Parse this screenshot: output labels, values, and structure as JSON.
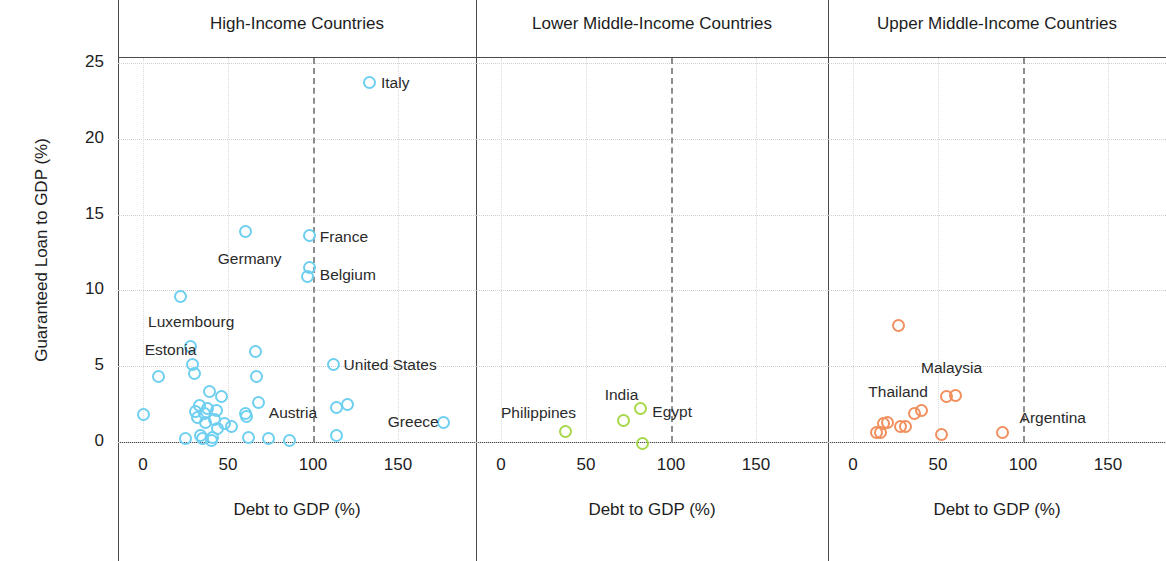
{
  "chart_data": {
    "type": "scatter",
    "title": "",
    "xlabel": "Debt to GDP (%)",
    "ylabel": "Guaranteed Loan to GDP (%)",
    "xlim": [
      -12,
      196
    ],
    "ylim": [
      -1.8,
      25.8
    ],
    "xticks": [
      0,
      50,
      100,
      150
    ],
    "yticks": [
      0,
      5,
      10,
      15,
      20,
      25
    ],
    "grid": true,
    "legend": "none",
    "threshold_line": {
      "x": 100,
      "style": "dashed",
      "color": "#8d8d8d"
    },
    "panels": [
      {
        "id": "high-income",
        "title": "High-Income Countries",
        "color": "#6ECFF0",
        "points": [
          {
            "x": 0,
            "y": 1.8
          },
          {
            "x": 9,
            "y": 4.3
          },
          {
            "x": 22,
            "y": 9.6
          },
          {
            "x": 25,
            "y": 0.2
          },
          {
            "x": 28,
            "y": 6.3
          },
          {
            "x": 29,
            "y": 5.1
          },
          {
            "x": 30,
            "y": 4.5
          },
          {
            "x": 31,
            "y": 2.0
          },
          {
            "x": 32,
            "y": 1.6
          },
          {
            "x": 33,
            "y": 2.4
          },
          {
            "x": 34,
            "y": 0.4
          },
          {
            "x": 35,
            "y": 0.2
          },
          {
            "x": 36,
            "y": 1.9
          },
          {
            "x": 37,
            "y": 1.3
          },
          {
            "x": 38,
            "y": 2.2
          },
          {
            "x": 39,
            "y": 3.3
          },
          {
            "x": 40,
            "y": 0.1
          },
          {
            "x": 41,
            "y": 0.3
          },
          {
            "x": 42,
            "y": 1.5
          },
          {
            "x": 43,
            "y": 2.1
          },
          {
            "x": 44,
            "y": 0.9
          },
          {
            "x": 46,
            "y": 3.0
          },
          {
            "x": 48,
            "y": 1.2
          },
          {
            "x": 52,
            "y": 1.0
          },
          {
            "x": 60,
            "y": 13.9
          },
          {
            "x": 60,
            "y": 1.9
          },
          {
            "x": 61,
            "y": 1.7
          },
          {
            "x": 62,
            "y": 0.3
          },
          {
            "x": 66,
            "y": 6.0
          },
          {
            "x": 67,
            "y": 4.3
          },
          {
            "x": 68,
            "y": 2.6
          },
          {
            "x": 74,
            "y": 0.2
          },
          {
            "x": 86,
            "y": 0.1
          },
          {
            "x": 98,
            "y": 13.6
          },
          {
            "x": 98,
            "y": 11.5
          },
          {
            "x": 97,
            "y": 10.9
          },
          {
            "x": 112,
            "y": 5.1
          },
          {
            "x": 114,
            "y": 2.3
          },
          {
            "x": 114,
            "y": 0.4
          },
          {
            "x": 120,
            "y": 2.5
          },
          {
            "x": 133,
            "y": 23.7
          },
          {
            "x": 177,
            "y": 1.3
          }
        ],
        "labels": [
          {
            "text": "Italy",
            "x": 140,
            "y": 23.7,
            "anchor": "left"
          },
          {
            "text": "France",
            "x": 104,
            "y": 13.5,
            "anchor": "left"
          },
          {
            "text": "Belgium",
            "x": 104,
            "y": 11.0,
            "anchor": "left"
          },
          {
            "text": "Germany",
            "x": 44,
            "y": 12.1,
            "anchor": "left"
          },
          {
            "text": "Luxembourg",
            "x": 3,
            "y": 7.9,
            "anchor": "left"
          },
          {
            "text": "Estonia",
            "x": 1,
            "y": 6.1,
            "anchor": "left"
          },
          {
            "text": "United States",
            "x": 118,
            "y": 5.1,
            "anchor": "left"
          },
          {
            "text": "Austria",
            "x": 74,
            "y": 1.9,
            "anchor": "left"
          },
          {
            "text": "Greece",
            "x": 144,
            "y": 1.3,
            "anchor": "left"
          }
        ]
      },
      {
        "id": "lower-middle-income",
        "title": "Lower Middle-Income Countries",
        "color": "#A6D84A",
        "points": [
          {
            "x": 38,
            "y": 0.7
          },
          {
            "x": 72,
            "y": 1.4
          },
          {
            "x": 82,
            "y": 2.2
          },
          {
            "x": 83,
            "y": -0.1
          }
        ],
        "labels": [
          {
            "text": "Philippines",
            "x": 0,
            "y": 1.9,
            "anchor": "left"
          },
          {
            "text": "India",
            "x": 61,
            "y": 3.1,
            "anchor": "left"
          },
          {
            "text": "Egypt",
            "x": 89,
            "y": 2.0,
            "anchor": "left"
          }
        ]
      },
      {
        "id": "upper-middle-income",
        "title": "Upper Middle-Income Countries",
        "color": "#F18F5E",
        "points": [
          {
            "x": 27,
            "y": 7.7
          },
          {
            "x": 14,
            "y": 0.6
          },
          {
            "x": 16,
            "y": 0.6
          },
          {
            "x": 18,
            "y": 1.2
          },
          {
            "x": 20,
            "y": 1.3
          },
          {
            "x": 28,
            "y": 1.0
          },
          {
            "x": 31,
            "y": 1.0
          },
          {
            "x": 36,
            "y": 1.9
          },
          {
            "x": 40,
            "y": 2.1
          },
          {
            "x": 52,
            "y": 0.5
          },
          {
            "x": 55,
            "y": 3.0
          },
          {
            "x": 60,
            "y": 3.1
          },
          {
            "x": 88,
            "y": 0.6
          }
        ],
        "labels": [
          {
            "text": "Malaysia",
            "x": 40,
            "y": 4.9,
            "anchor": "left"
          },
          {
            "text": "Thailand",
            "x": 9,
            "y": 3.3,
            "anchor": "left"
          },
          {
            "text": "Argentina",
            "x": 98,
            "y": 1.6,
            "anchor": "left"
          }
        ]
      }
    ]
  }
}
